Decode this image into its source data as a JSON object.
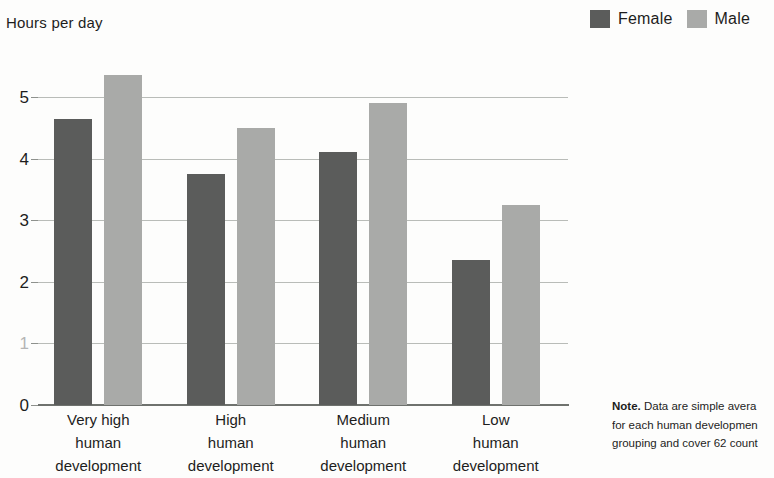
{
  "chart_data": {
    "type": "bar",
    "title": "Hours per day",
    "xlabel": "",
    "ylabel": "Hours per day",
    "categories": [
      "Very high\nhuman\ndevelopment",
      "High\nhuman\ndevelopment",
      "Medium\nhuman\ndevelopment",
      "Low\nhuman\ndevelopment"
    ],
    "series": [
      {
        "name": "Female",
        "color": "#5b5c5b",
        "values": [
          4.65,
          3.75,
          4.1,
          2.35
        ]
      },
      {
        "name": "Male",
        "color": "#a9aaa8",
        "values": [
          5.35,
          4.5,
          4.9,
          3.25
        ]
      }
    ],
    "ylim": [
      0,
      5.6
    ],
    "yticks": [
      0,
      1,
      2,
      3,
      4,
      5
    ],
    "ytick_labels": [
      "0",
      "1",
      "2",
      "3",
      "4",
      "5"
    ],
    "grid": true,
    "legend_position": "top-right"
  },
  "legend": {
    "items": [
      {
        "label": "Female",
        "swatch_name": "legend-swatch-female",
        "color": "#5b5c5b"
      },
      {
        "label": "Male",
        "swatch_name": "legend-swatch-male",
        "color": "#a9aaa8"
      }
    ]
  },
  "note": {
    "prefix": "Note.",
    "lines": [
      "Data are simple avera",
      "for each human developmen",
      "grouping and cover 62 count"
    ]
  }
}
